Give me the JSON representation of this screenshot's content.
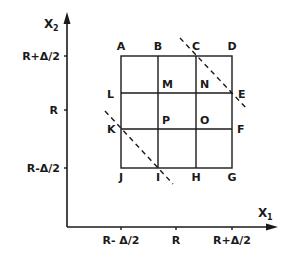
{
  "axes": {
    "x_label": "X",
    "x_subscript": "1",
    "y_label": "X",
    "y_subscript": "2",
    "x_ticks": [
      "R- Δ/2",
      "R",
      "R+Δ/2"
    ],
    "y_ticks": [
      "R+Δ/2",
      "R",
      "R-Δ/2"
    ]
  },
  "points": {
    "A": "A",
    "B": "B",
    "C": "C",
    "D": "D",
    "E": "E",
    "F": "F",
    "G": "G",
    "H": "H",
    "I": "I",
    "J": "J",
    "K": "K",
    "L": "L",
    "M": "M",
    "N": "N",
    "O": "O",
    "P": "P"
  }
}
